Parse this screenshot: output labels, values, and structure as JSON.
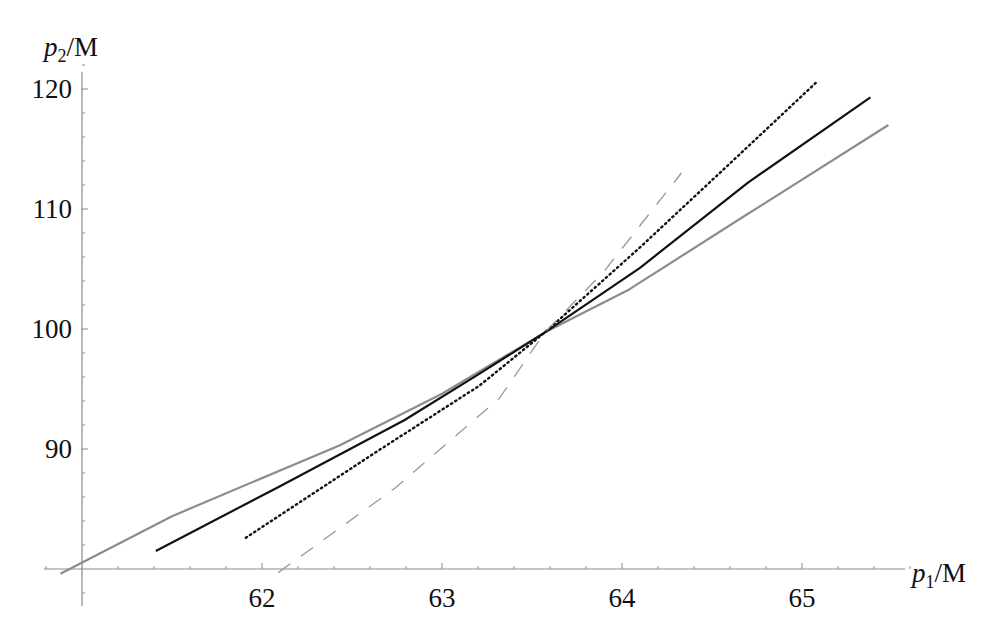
{
  "chart_data": {
    "type": "line",
    "title": "",
    "xlabel": "p1/M",
    "ylabel": "p2/M",
    "xlabel_parts": {
      "var": "p",
      "sub": "1",
      "unit": "/M"
    },
    "ylabel_parts": {
      "var": "p",
      "sub": "2",
      "unit": "/M"
    },
    "xlim": [
      60.8,
      66.3
    ],
    "ylim": [
      77,
      121.5
    ],
    "axes_origin": [
      61,
      80
    ],
    "x_ticks": [
      62,
      63,
      64,
      65
    ],
    "x_tick_labels": [
      "62",
      "63",
      "64",
      "65"
    ],
    "x_minor_step": 0.2,
    "y_ticks": [
      90,
      100,
      110,
      120
    ],
    "y_tick_labels": [
      "90",
      "100",
      "110",
      "120"
    ],
    "y_minor_step": 2,
    "grid": false,
    "legend": null,
    "series": [
      {
        "name": "gray-solid",
        "style": "solid",
        "color": "#8c8c8c",
        "points": [
          [
            60.88,
            79.6
          ],
          [
            61.5,
            84.4
          ],
          [
            62.43,
            90.3
          ],
          [
            63.0,
            94.6
          ],
          [
            63.57,
            99.7
          ],
          [
            64.04,
            103.3
          ],
          [
            64.7,
            109.6
          ],
          [
            65.48,
            117.0
          ]
        ]
      },
      {
        "name": "black-solid",
        "style": "solid",
        "color": "#111111",
        "points": [
          [
            61.41,
            81.5
          ],
          [
            62.1,
            86.9
          ],
          [
            62.79,
            92.4
          ],
          [
            63.2,
            96.2
          ],
          [
            63.57,
            99.7
          ],
          [
            64.1,
            105.1
          ],
          [
            64.7,
            112.2
          ],
          [
            65.38,
            119.3
          ]
        ]
      },
      {
        "name": "black-dotted",
        "style": "dotted",
        "color": "#111111",
        "points": [
          [
            61.91,
            82.6
          ],
          [
            62.66,
            90.0
          ],
          [
            63.21,
            95.3
          ],
          [
            63.57,
            99.7
          ],
          [
            64.1,
            106.8
          ],
          [
            64.6,
            113.8
          ],
          [
            65.09,
            120.7
          ]
        ]
      },
      {
        "name": "gray-dashed",
        "style": "dashed",
        "color": "#999999",
        "points": [
          [
            62.09,
            79.7
          ],
          [
            62.74,
            86.75
          ],
          [
            63.32,
            94.25
          ],
          [
            63.57,
            99.7
          ],
          [
            63.9,
            104.8
          ],
          [
            64.33,
            113.0
          ]
        ]
      }
    ]
  }
}
